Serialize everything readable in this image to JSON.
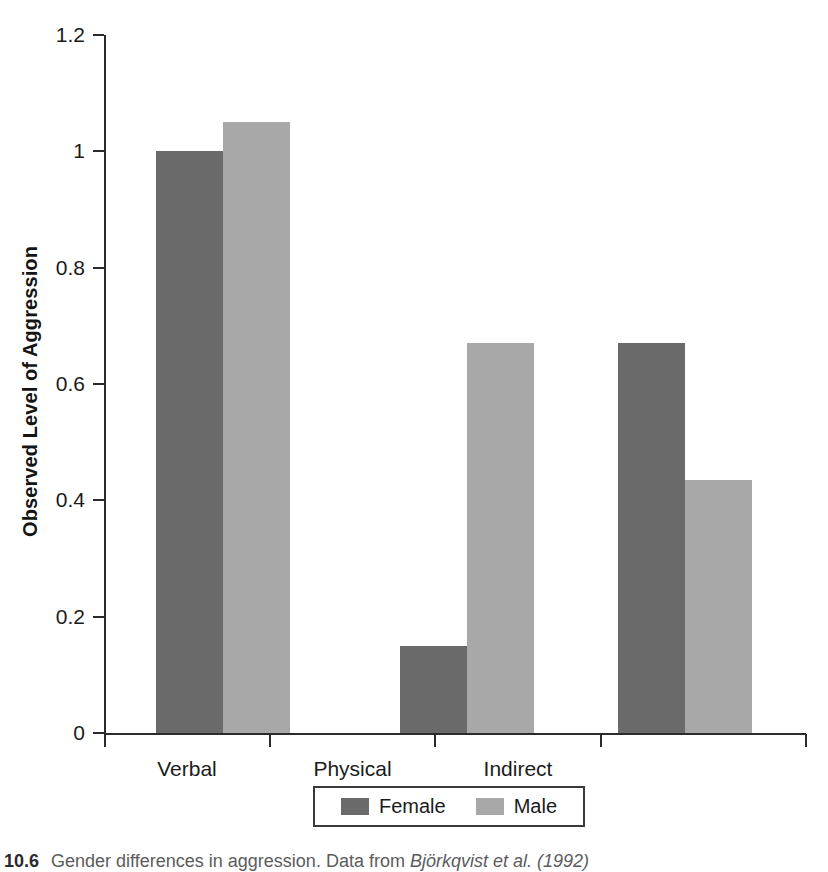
{
  "chart_data": {
    "type": "bar",
    "title": "",
    "xlabel": "",
    "ylabel": "Observed Level of Aggression",
    "categories": [
      "Verbal",
      "Physical",
      "Indirect"
    ],
    "series": [
      {
        "name": "Female",
        "color": "#6a6a6a",
        "values": [
          1.0,
          0.15,
          0.67
        ]
      },
      {
        "name": "Male",
        "color": "#a8a8a8",
        "values": [
          1.05,
          0.67,
          0.435
        ]
      }
    ],
    "ylim": [
      0,
      1.2
    ],
    "ytick_values": [
      0,
      0.2,
      0.4,
      0.6,
      0.8,
      1.0,
      1.2
    ],
    "ytick_labels": [
      "0",
      "0.2",
      "0.4",
      "0.6",
      "0.8",
      "1",
      "1.2"
    ],
    "grid": false,
    "legend_position": "bottom-center",
    "legend_entries": [
      "Female",
      "Male"
    ]
  },
  "axes": {
    "y_title": "Observed Level of Aggression"
  },
  "legend": {
    "female_label": "Female",
    "male_label": "Male"
  },
  "caption": {
    "number": "10.6",
    "text_part1": "Gender differences in aggression. Data from ",
    "text_part2": "Björkqvist et al. (1992)"
  }
}
